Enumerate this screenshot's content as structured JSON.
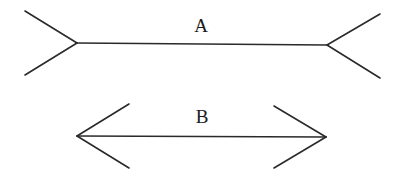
{
  "figure": {
    "stroke_color": "#2a2a2a",
    "figures": [
      {
        "label": "A",
        "label_pos": [
          201,
          16
        ],
        "shaft": [
          [
            77,
            43
          ],
          [
            327,
            45
          ]
        ],
        "left_fins": [
          [
            [
              25,
              11
            ],
            [
              77,
              43
            ]
          ],
          [
            [
              25,
              75
            ],
            [
              77,
              43
            ]
          ]
        ],
        "right_fins": [
          [
            [
              327,
              45
            ],
            [
              380,
              14
            ]
          ],
          [
            [
              327,
              45
            ],
            [
              380,
              78
            ]
          ]
        ],
        "fin_style": "outward (tails)"
      },
      {
        "label": "B",
        "label_pos": [
          202,
          107
        ],
        "shaft": [
          [
            77,
            136
          ],
          [
            326,
            137
          ]
        ],
        "left_fins": [
          [
            [
              77,
              136
            ],
            [
              129,
              104
            ]
          ],
          [
            [
              77,
              136
            ],
            [
              129,
              168
            ]
          ]
        ],
        "right_fins": [
          [
            [
              274,
              106
            ],
            [
              326,
              137
            ]
          ],
          [
            [
              274,
              168
            ],
            [
              326,
              137
            ]
          ]
        ],
        "fin_style": "inward (arrowheads)"
      }
    ]
  }
}
